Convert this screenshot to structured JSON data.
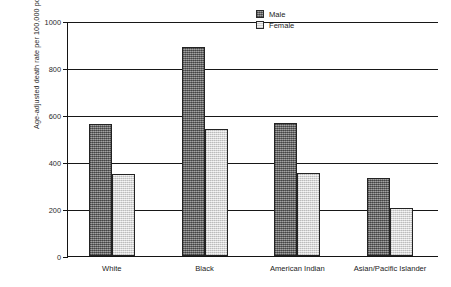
{
  "chart_data": {
    "type": "bar",
    "title": "",
    "xlabel": "",
    "ylabel": "Age-adjusted death rate per 100,000 population",
    "ylim": [
      0,
      1000
    ],
    "yticks": [
      0,
      200,
      400,
      600,
      800,
      1000
    ],
    "ytick_labels": [
      "0",
      "200",
      "400",
      "600",
      "800",
      "1000"
    ],
    "grid": true,
    "grid_axis": "y",
    "legend_position": "top-right-inside",
    "categories": [
      "White",
      "Black",
      "American Indian",
      "Asian/Pacific Islander"
    ],
    "series": [
      {
        "name": "Male",
        "values": [
          560,
          890,
          565,
          330
        ],
        "color": "#7d7d7d",
        "fill": "dark-hatched"
      },
      {
        "name": "Female",
        "values": [
          350,
          540,
          355,
          205
        ],
        "color": "#dedede",
        "fill": "light-stippled"
      }
    ]
  },
  "legend": {
    "items": [
      {
        "label": "Male"
      },
      {
        "label": "Female"
      }
    ]
  },
  "axes": {
    "y_title": "Age-adjusted death rate per 100,000 population"
  }
}
